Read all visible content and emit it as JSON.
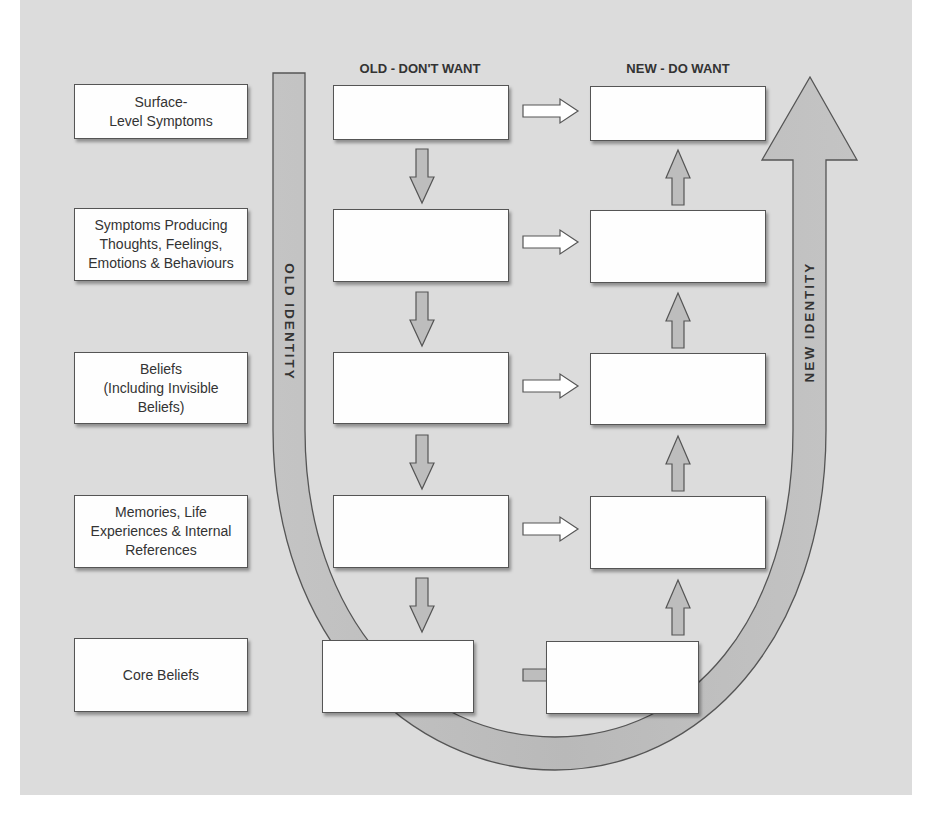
{
  "columns": {
    "old_header": "OLD - DON'T WANT",
    "new_header": "NEW - DO WANT"
  },
  "identity": {
    "old_label": "OLD IDENTITY",
    "new_label": "NEW IDENTITY"
  },
  "levels": [
    {
      "label": "Surface-\nLevel Symptoms",
      "old_value": "",
      "new_value": "",
      "right_arrow_style": "white"
    },
    {
      "label": "Symptoms Producing\nThoughts, Feelings,\nEmotions & Behaviours",
      "old_value": "",
      "new_value": "",
      "right_arrow_style": "white"
    },
    {
      "label": "Beliefs\n(Including Invisible\nBeliefs)",
      "old_value": "",
      "new_value": "",
      "right_arrow_style": "white"
    },
    {
      "label": "Memories, Life\nExperiences & Internal\nReferences",
      "old_value": "",
      "new_value": "",
      "right_arrow_style": "white"
    },
    {
      "label": "Core Beliefs",
      "old_value": "",
      "new_value": "",
      "right_arrow_style": "gray"
    }
  ],
  "colors": {
    "background": "#dcdcdc",
    "arrow_fill": "#bdbdbd",
    "box_fill": "#fefefe",
    "outline": "#444444"
  }
}
